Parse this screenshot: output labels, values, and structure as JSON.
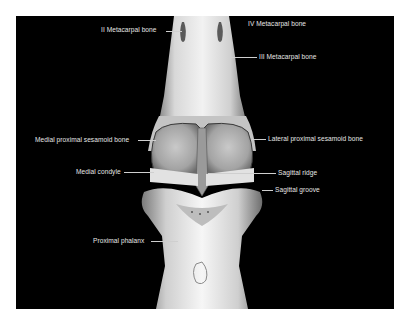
{
  "figure": {
    "background": "#000000",
    "frame": "#ffffff",
    "labels": {
      "ii_metacarpal": "II Metacarpal bone",
      "iv_metacarpal": "IV Metacarpal bone",
      "iii_metacarpal": "III Metacarpal bone",
      "medial_sesamoid": "Medial proximal sesamoid bone",
      "medial_condyle": "Medial condyle",
      "lateral_sesamoid": "Lateral proximal sesamoid bone",
      "sagittal_ridge": "Sagittal ridge",
      "sagittal_groove": "Sagittal groove",
      "proximal_phalanx": "Proximal phalanx"
    }
  }
}
